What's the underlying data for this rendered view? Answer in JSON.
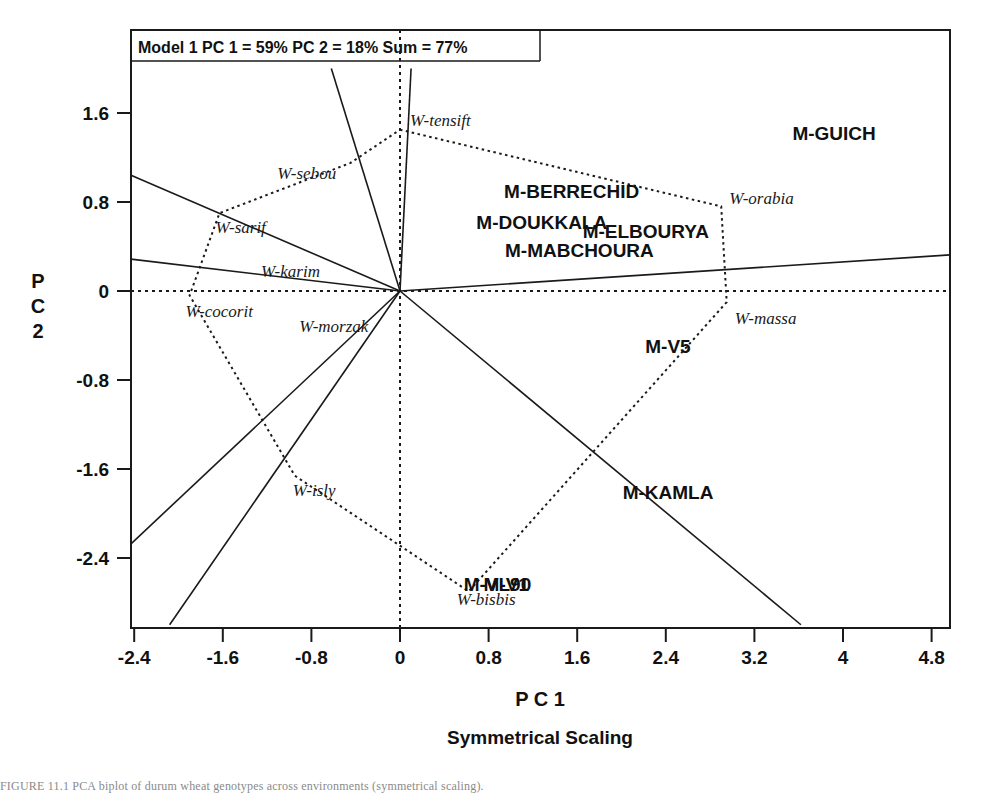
{
  "figure": {
    "model_title": "Model 1 PC 1 = 59% PC 2 = 18% Sum = 77%",
    "x_axis_title": "P C 1",
    "y_axis_title_lines": [
      "P",
      "C",
      "2"
    ],
    "subtitle": "Symmetrical Scaling",
    "colors": {
      "frame": "#1a1a1a",
      "ray": "#1a1a1a",
      "polygon": "#1a1a1a",
      "zero_line": "#1a1a1a",
      "text": "#111111"
    }
  },
  "chart_data": {
    "type": "scatter",
    "title": "Model 1 PC 1 = 59% PC 2 = 18% Sum = 77%",
    "subtitle": "Symmetrical Scaling",
    "xlabel": "P C 1",
    "ylabel": "P C 2",
    "xlim": [
      -2.8,
      5.2
    ],
    "ylim": [
      -3.0,
      2.0
    ],
    "xticks": [
      "-2.4",
      "-1.6",
      "-0.8",
      "0",
      "0.8",
      "1.6",
      "2.4",
      "3.2",
      "4",
      "4.8"
    ],
    "xtick_values": [
      -2.4,
      -1.6,
      -0.8,
      0,
      0.8,
      1.6,
      2.4,
      3.2,
      4,
      4.8
    ],
    "yticks": [
      "1.6",
      "0.8",
      "0",
      "-0.8",
      "-1.6",
      "-2.4"
    ],
    "ytick_values": [
      1.6,
      0.8,
      0,
      -0.8,
      -1.6,
      -2.4
    ],
    "grid": false,
    "legend": "none",
    "variance_explained": {
      "pc1": "59%",
      "pc2": "18%",
      "sum": "77%"
    },
    "variables": [
      {
        "name": "W-tensift",
        "x": 0.0,
        "y": 1.45
      },
      {
        "name": "W-sebou",
        "x": -0.45,
        "y": 1.15
      },
      {
        "name": "W-sarif",
        "x": -1.63,
        "y": 0.7
      },
      {
        "name": "W-karim",
        "x": -1.2,
        "y": 0.36
      },
      {
        "name": "W-cocorit",
        "x": -1.9,
        "y": -0.04
      },
      {
        "name": "W-morzak",
        "x": -0.08,
        "y": -0.1
      },
      {
        "name": "W-orabia",
        "x": 2.9,
        "y": 0.76
      },
      {
        "name": "W-massa",
        "x": 2.95,
        "y": -0.1
      },
      {
        "name": "W-isly",
        "x": -0.95,
        "y": -1.66
      },
      {
        "name": "W-bisbis",
        "x": 0.62,
        "y": -2.7
      }
    ],
    "sites": [
      {
        "name": "M-GUICH",
        "x": 3.92,
        "y": 1.36
      },
      {
        "name": "M-BERRECHID",
        "x": 1.55,
        "y": 0.84
      },
      {
        "name": "M-DOUKKALA",
        "x": 1.28,
        "y": 0.56
      },
      {
        "name": "M-ELBOURYA",
        "x": 2.22,
        "y": 0.48
      },
      {
        "name": "M-MABCHOURA",
        "x": 1.62,
        "y": 0.31
      },
      {
        "name": "M-V5",
        "x": 2.42,
        "y": -0.56
      },
      {
        "name": "M-KAMLA",
        "x": 2.42,
        "y": -1.87
      },
      {
        "name": "M-VL90",
        "x": 0.88,
        "y": -2.7
      },
      {
        "name": "M-V1",
        "x": 0.96,
        "y": -2.7
      }
    ],
    "hull_polygon": [
      "W-tensift",
      "W-orabia",
      "W-massa",
      "W-bisbis",
      "W-isly",
      "W-cocorit",
      "W-sarif",
      "W-sebou"
    ],
    "vector_rays": [
      {
        "name": "ray-to-upper-left-far",
        "x": -2.8,
        "y": 1.2
      },
      {
        "name": "ray-to-sarif",
        "x": -2.8,
        "y": 0.33
      },
      {
        "name": "ray-to-upper-steep-a",
        "x": -0.62,
        "y": 2.0
      },
      {
        "name": "ray-to-upper-steep-b",
        "x": 0.1,
        "y": 2.0
      },
      {
        "name": "ray-to-right-shallow",
        "x": 5.2,
        "y": 0.34
      },
      {
        "name": "ray-to-lower-left-a",
        "x": -2.8,
        "y": -2.62
      },
      {
        "name": "ray-to-lower-left-b",
        "x": -2.08,
        "y": -3.0
      },
      {
        "name": "ray-to-lower-right",
        "x": 3.62,
        "y": -3.0
      }
    ]
  },
  "caption": {
    "text": "FIGURE 11.1   PCA biplot of durum wheat genotypes across environments (symmetrical scaling)."
  }
}
